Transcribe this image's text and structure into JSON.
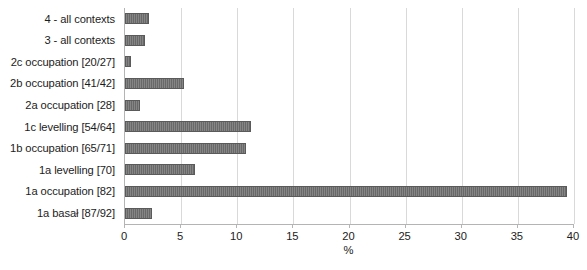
{
  "chart_data": {
    "type": "bar",
    "orientation": "horizontal",
    "title": "",
    "subtitle": "",
    "xlabel": "%",
    "ylabel": "",
    "xlim": [
      0,
      40
    ],
    "xticks": [
      0,
      5,
      10,
      15,
      20,
      25,
      30,
      35,
      40
    ],
    "xtick_labels": [
      "0",
      "5",
      "10",
      "15",
      "20",
      "25",
      "30",
      "35",
      "40"
    ],
    "grid": "vertical",
    "legend": "none",
    "bar_color": "#6e6e6e",
    "gridline_color": "#d9d9d9",
    "axis_color": "#b4b4b4",
    "categories": [
      "4 - all contexts",
      "3 - all contexts",
      "2c occupation [20/27]",
      "2b occupation [41/42]",
      "2a occupation [28]",
      "1c levelling [54/64]",
      "1b occupation [65/71]",
      "1a levelling [70]",
      "1a occupation [82]",
      "1a basał [87/92]"
    ],
    "values": [
      2.1,
      1.8,
      0.5,
      5.3,
      1.3,
      11.2,
      10.8,
      6.2,
      39.4,
      2.4
    ]
  }
}
